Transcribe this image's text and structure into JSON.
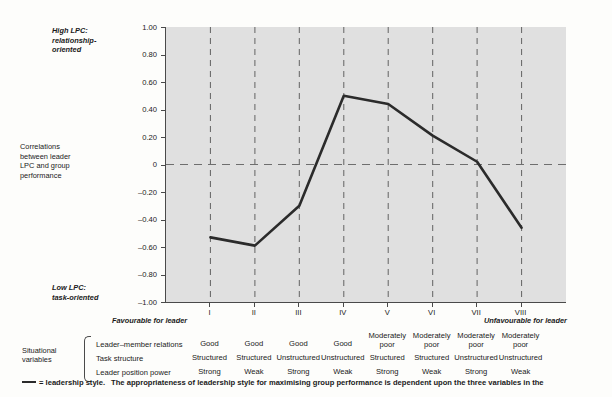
{
  "axis_annotations": {
    "high_lpc": "High LPC:\nrelationship-\noriented",
    "correlations": "Correlations\nbetween leader\nLPC and group\nperformance",
    "low_lpc": "Low LPC:\ntask-oriented",
    "favourable_left": "Favourable for leader",
    "favourable_right": "Unfavourable for leader"
  },
  "situational": {
    "title": "Situational\nvariables",
    "rows": [
      {
        "label": "Leader–member relations",
        "values": [
          "Good",
          "Good",
          "Good",
          "Good",
          "Moderately\npoor",
          "Moderately\npoor",
          "Moderately\npoor",
          "Moderately\npoor"
        ]
      },
      {
        "label": "Task structure",
        "values": [
          "Structured",
          "Structured",
          "Unstructured",
          "Unstructured",
          "Structured",
          "Structured",
          "Unstructured",
          "Unstructured"
        ]
      },
      {
        "label": "Leader position power",
        "values": [
          "Strong",
          "Weak",
          "Strong",
          "Weak",
          "Strong",
          "Weak",
          "Strong",
          "Weak"
        ]
      }
    ]
  },
  "legend": {
    "swatch_name": "line-swatch",
    "text": "= leadership style.",
    "caption": "The appropriateness of leadership style for maximising group performance is dependent upon the three variables in the"
  },
  "colors": {
    "plot_background": "#e0e0e0",
    "line": "#2b2b2b",
    "axis": "#4a4a4a",
    "grid": "#6e6e6e",
    "page_background": "#fdfdfb"
  },
  "chart_data": {
    "type": "line",
    "title": "",
    "xlabel": "",
    "ylabel": "Correlations between leader LPC and group performance",
    "categories": [
      "I",
      "II",
      "III",
      "IV",
      "V",
      "VI",
      "VII",
      "VIII"
    ],
    "series": [
      {
        "name": "leadership style",
        "values": [
          -0.53,
          -0.59,
          -0.3,
          0.5,
          0.44,
          0.21,
          0.02,
          -0.46
        ]
      }
    ],
    "ylim": [
      -1.0,
      1.0
    ],
    "yticks": [
      1.0,
      0.8,
      0.6,
      0.4,
      0.2,
      0,
      -0.2,
      -0.4,
      -0.6,
      -0.8,
      -1.0
    ],
    "ytick_labels": [
      "1.00",
      "0.80",
      "0.60",
      "0.40",
      "0.20",
      "0",
      "–0.20",
      "–0.40",
      "–0.60",
      "–0.80",
      "–1.00"
    ],
    "grid": "vertical dashed at each category, horizontal dashed at y=0",
    "legend_position": "below-chart"
  }
}
